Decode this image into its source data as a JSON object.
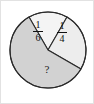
{
  "figure": {
    "name": "pie-chart-fractions",
    "frame_border_color": "#e2e2e2",
    "background": "#ffffff",
    "outline_color": "#2b2b2b"
  },
  "chart_data": {
    "type": "pie",
    "title": "",
    "legend": "none",
    "center": {
      "x": 47,
      "y": 49
    },
    "radius": 38,
    "categories": [
      "1/6",
      "1/4",
      "?"
    ],
    "values": [
      0.1667,
      0.25,
      0.5833
    ],
    "labels": [
      "1/6",
      "1/4",
      "?"
    ],
    "slices": [
      {
        "name": "slice-one-sixth",
        "label": "1/6",
        "numerator": "1",
        "denominator": "6",
        "value": 0.1667,
        "start_angle_deg": 240,
        "end_angle_deg": 300,
        "fill": "#f4f4f4",
        "label_x": 37,
        "label_y": 29
      },
      {
        "name": "slice-one-quarter",
        "label": "1/4",
        "numerator": "1",
        "denominator": "4",
        "value": 0.25,
        "start_angle_deg": 300,
        "end_angle_deg": 390,
        "fill": "#ededed",
        "label_x": 61,
        "label_y": 30
      },
      {
        "name": "slice-unknown",
        "label": "?",
        "value": 0.5833,
        "start_angle_deg": 30,
        "end_angle_deg": 240,
        "fill": "#d2d2d2",
        "label_x": 46,
        "label_y": 69
      }
    ],
    "xlabel": "",
    "ylabel": ""
  }
}
